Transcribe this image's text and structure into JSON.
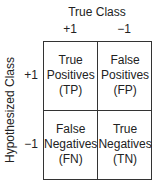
{
  "title_top": "True Class",
  "title_side": "Hypothesized Class",
  "columns": [
    "+1",
    "−1"
  ],
  "rows": [
    "+1",
    "−1"
  ],
  "cells": [
    {
      "line1": "True",
      "line2": "Positives",
      "abbr": "(TP)"
    },
    {
      "line1": "False",
      "line2": "Positives",
      "abbr": "(FP)"
    },
    {
      "line1": "False",
      "line2": "Negatives",
      "abbr": "(FN)"
    },
    {
      "line1": "True",
      "line2": "Negatives",
      "abbr": "(TN)"
    }
  ]
}
